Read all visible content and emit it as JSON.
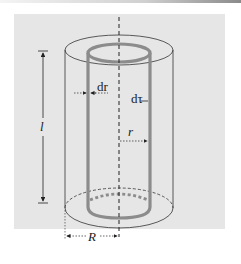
{
  "figure": {
    "type": "cylindrical-shell-diagram",
    "labels": {
      "length": "l",
      "shell_thickness": "dr",
      "volume_element": "dτ",
      "shell_radius": "r",
      "outer_radius": "R"
    },
    "colors": {
      "background_panel": "#e6e6e6",
      "outline": "#333333",
      "shell": "#8c8c8c",
      "axis": "#222222"
    }
  }
}
